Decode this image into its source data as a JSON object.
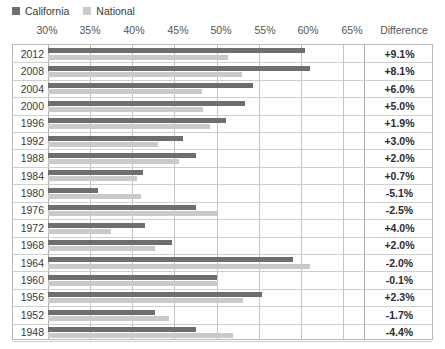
{
  "legend": {
    "items": [
      {
        "label": "California",
        "color": "#6e6e6e",
        "icon": "square-swatch-icon"
      },
      {
        "label": "National",
        "color": "#cacaca",
        "icon": "square-swatch-icon"
      }
    ]
  },
  "axis": {
    "tick_labels": [
      "30%",
      "35%",
      "40%",
      "45%",
      "50%",
      "55%",
      "60%",
      "65%"
    ],
    "tick_values": [
      30,
      35,
      40,
      45,
      50,
      55,
      60,
      65
    ],
    "min": 30,
    "max": 67.5
  },
  "columns": {
    "difference_header": "Difference"
  },
  "chart_data": {
    "type": "bar",
    "orientation": "horizontal",
    "title": "",
    "subtitle": "",
    "xlabel": "",
    "ylabel": "",
    "xlim": [
      30,
      67.5
    ],
    "grid": true,
    "legend_position": "top-left",
    "categories": [
      "2012",
      "2008",
      "2004",
      "2000",
      "1996",
      "1992",
      "1988",
      "1984",
      "1980",
      "1976",
      "1972",
      "1968",
      "1964",
      "1960",
      "1956",
      "1952",
      "1948"
    ],
    "series": [
      {
        "name": "California",
        "color": "#6e6e6e",
        "values": [
          60.5,
          61.1,
          54.3,
          53.4,
          51.1,
          46.0,
          47.6,
          41.3,
          35.9,
          47.6,
          41.5,
          44.7,
          59.1,
          50.1,
          55.4,
          42.7,
          47.6
        ]
      },
      {
        "name": "National",
        "color": "#cacaca",
        "values": [
          51.4,
          53.0,
          48.3,
          48.4,
          49.2,
          43.0,
          45.6,
          40.6,
          41.0,
          50.1,
          37.5,
          42.7,
          61.1,
          50.2,
          53.1,
          44.4,
          52.0
        ]
      }
    ],
    "difference_label": "Difference",
    "difference": [
      "+9.1%",
      "+8.1%",
      "+6.0%",
      "+5.0%",
      "+1.9%",
      "+3.0%",
      "+2.0%",
      "+0.7%",
      "-5.1%",
      "-2.5%",
      "+4.0%",
      "+2.0%",
      "-2.0%",
      "-0.1%",
      "+2.3%",
      "-1.7%",
      "-4.4%"
    ]
  }
}
